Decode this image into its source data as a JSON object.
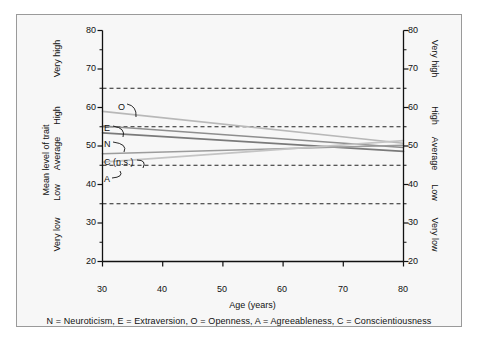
{
  "figure": {
    "background_color": "#f7f7f7",
    "border_color": "#9a9a9a",
    "page_color": "#ffffff"
  },
  "chart_data": {
    "type": "line",
    "title": "",
    "xlabel": "Age (years)",
    "ylabel": "Mean level of trait",
    "xlim": [
      30,
      80
    ],
    "ylim": [
      20,
      80
    ],
    "xticks": [
      30,
      40,
      50,
      60,
      70,
      80
    ],
    "yticks": [
      20,
      30,
      40,
      50,
      60,
      70,
      80
    ],
    "yminorticks": [
      25,
      35,
      45,
      55,
      65,
      75
    ],
    "grid": false,
    "legend_position": "inline-left-labels",
    "x": [
      30,
      80
    ],
    "y_category_bands": [
      {
        "label": "Very low",
        "range": [
          20,
          35
        ]
      },
      {
        "label": "Low",
        "range": [
          35,
          45
        ]
      },
      {
        "label": "Average",
        "range": [
          45,
          55
        ]
      },
      {
        "label": "High",
        "range": [
          55,
          65
        ]
      },
      {
        "label": "Very high",
        "range": [
          65,
          80
        ]
      }
    ],
    "reference_lines": [
      {
        "value": 65,
        "style": "dashed"
      },
      {
        "value": 55,
        "style": "dashed"
      },
      {
        "value": 45,
        "style": "dashed"
      },
      {
        "value": 35,
        "style": "dashed"
      }
    ],
    "series": [
      {
        "name": "O",
        "label": "O",
        "trait": "Openness",
        "values": [
          59.0,
          50.7
        ],
        "color": "#b8b8b8"
      },
      {
        "name": "E",
        "label": "E",
        "trait": "Extraversion",
        "values": [
          55.2,
          49.6
        ],
        "color": "#8e8e8e"
      },
      {
        "name": "N",
        "label": "N",
        "trait": "Neuroticism",
        "values": [
          53.4,
          48.6
        ],
        "color": "#7a7a7a"
      },
      {
        "name": "C",
        "label": "C (n.s.)",
        "trait": "Conscientiousness",
        "values": [
          48.0,
          50.2
        ],
        "color": "#9c9c9c"
      },
      {
        "name": "A",
        "label": "A",
        "trait": "Agreeableness",
        "values": [
          45.8,
          51.4
        ],
        "color": "#c4c4c4"
      }
    ],
    "caption": "N = Neuroticism, E = Extraversion, O = Openness, A = Agreeableness, C = Conscientiousness"
  },
  "axes": {
    "left": {
      "tick_labels": [
        "80",
        "70",
        "60",
        "50",
        "40",
        "30",
        "20"
      ],
      "category_labels": [
        "Very high",
        "High",
        "Average",
        "Low",
        "Very low"
      ],
      "title": "Mean level of trait"
    },
    "right": {
      "tick_labels": [
        "80",
        "70",
        "60",
        "50",
        "40",
        "30",
        "20"
      ],
      "category_labels": [
        "Very high",
        "High",
        "Average",
        "Low",
        "Very low"
      ]
    },
    "bottom": {
      "tick_labels": [
        "30",
        "40",
        "50",
        "60",
        "70",
        "80"
      ],
      "title": "Age (years)"
    }
  },
  "series_labels": [
    {
      "text": "O",
      "trait": "Openness"
    },
    {
      "text": "E",
      "trait": "Extraversion"
    },
    {
      "text": "N",
      "trait": "Neuroticism"
    },
    {
      "text": "C (n.s.)",
      "trait": "Conscientiousness"
    },
    {
      "text": "A",
      "trait": "Agreeableness"
    }
  ],
  "caption": "N = Neuroticism, E = Extraversion, O = Openness, A = Agreeableness, C = Conscientiousness"
}
